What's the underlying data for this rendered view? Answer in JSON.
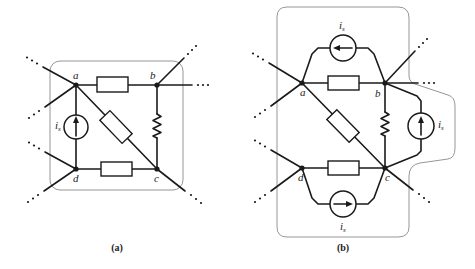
{
  "figures": [
    {
      "id": "a",
      "caption": "(a)",
      "nodes": {
        "a": "a",
        "b": "b",
        "c": "c",
        "d": "d"
      },
      "sources": [
        {
          "label": "i",
          "subscript": "s",
          "position": "between a and d",
          "arrow_direction": "up"
        }
      ],
      "elements": [
        {
          "type": "resistor-box",
          "between": "a-b"
        },
        {
          "type": "resistor-box",
          "between": "a-c (diagonal)"
        },
        {
          "type": "resistor-zigzag",
          "between": "b-c"
        },
        {
          "type": "resistor-box",
          "between": "d-c"
        },
        {
          "type": "current-source",
          "between": "d-a"
        }
      ]
    },
    {
      "id": "b",
      "caption": "(b)",
      "nodes": {
        "a": "a",
        "b": "b",
        "c": "c",
        "d": "d"
      },
      "sources": [
        {
          "label": "i",
          "subscript": "s",
          "position": "top, between a and b",
          "arrow_direction": "left"
        },
        {
          "label": "i",
          "subscript": "s",
          "position": "right, between c and b",
          "arrow_direction": "up"
        },
        {
          "label": "i",
          "subscript": "s",
          "position": "bottom, between d and c",
          "arrow_direction": "right"
        }
      ],
      "elements": [
        {
          "type": "resistor-box",
          "between": "a-b"
        },
        {
          "type": "resistor-box",
          "between": "a-c (diagonal)"
        },
        {
          "type": "resistor-zigzag",
          "between": "b-c"
        },
        {
          "type": "resistor-box",
          "between": "d-c"
        },
        {
          "type": "current-source",
          "between": "b-a (top)"
        },
        {
          "type": "current-source",
          "between": "c-b (right)"
        },
        {
          "type": "current-source",
          "between": "d-c (bottom)"
        }
      ]
    }
  ],
  "colors": {
    "wire": "#1a1a1a",
    "boundary": "#8a8a8a",
    "background": "#ffffff"
  }
}
